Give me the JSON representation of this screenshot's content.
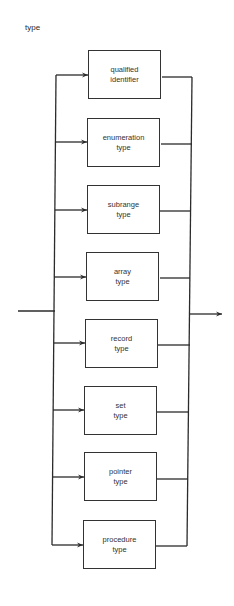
{
  "diagram": {
    "title": "type",
    "alternatives": [
      {
        "line1": "qualified",
        "line2": "identifier"
      },
      {
        "line1": "enumeration",
        "line2": "type"
      },
      {
        "line1": "subrange",
        "line2": "type"
      },
      {
        "line1": "array",
        "line2": "type"
      },
      {
        "line1": "record",
        "line2": "type"
      },
      {
        "line1": "set",
        "line2": "type"
      },
      {
        "line1": "pointer",
        "line2": "type"
      },
      {
        "line1": "procedure",
        "line2": "type"
      }
    ],
    "colors": {
      "line": "#2b2b2b",
      "background": "#ffffff"
    }
  }
}
